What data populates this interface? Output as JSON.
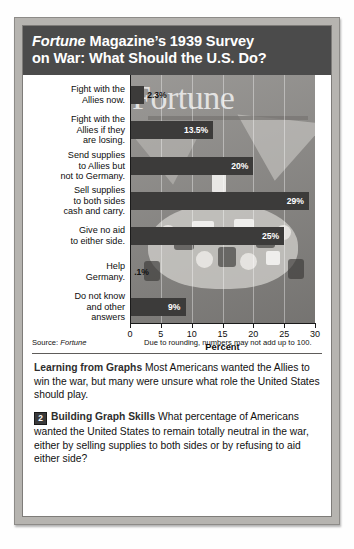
{
  "figure": {
    "title_prefix": "Fortune",
    "title_rest_line1": " Magazine’s 1939 Survey",
    "title_line2": "on War: What Should the U.S. Do?"
  },
  "chart_data": {
    "type": "bar",
    "orientation": "horizontal",
    "title": "Fortune Magazine’s 1939 Survey on War: What Should the U.S. Do?",
    "xlabel": "Percent",
    "ylabel": "",
    "xlim": [
      0,
      30
    ],
    "xticks": [
      "0",
      "5",
      "10",
      "15",
      "20",
      "25",
      "30"
    ],
    "grid": true,
    "legend": "none",
    "categories": [
      "Fight with the Allies now.",
      "Fight with the Allies if they are losing.",
      "Send supplies to Allies but not to Germany.",
      "Sell supplies to both sides cash and carry.",
      "Give no aid to either side.",
      "Help Germany.",
      "Do not know and other answers"
    ],
    "category_lines": [
      [
        "Fight with the",
        "Allies now."
      ],
      [
        "Fight with the",
        "Allies if they",
        "are losing."
      ],
      [
        "Send supplies",
        "to Allies but",
        "not to Germany."
      ],
      [
        "Sell supplies",
        "to both sides",
        "cash and carry."
      ],
      [
        "Give no aid",
        "to either side."
      ],
      [
        "Help",
        "Germany."
      ],
      [
        "Do not know",
        "and other",
        "answers"
      ]
    ],
    "values": [
      2.3,
      13.5,
      20,
      29,
      25,
      0.1,
      9
    ],
    "value_labels": [
      "2.3%",
      "13.5%",
      "20%",
      "29%",
      "25%",
      ".1%",
      "9%"
    ],
    "bar_color": "#3c3b3a",
    "source": "Source: Fortune",
    "source_label": "Source: ",
    "source_name": "Fortune",
    "note": "Due to rounding, numbers may not add up to 100."
  },
  "captions": [
    {
      "badge": "",
      "heading": "Learning from Graphs",
      "body": "Most Americans wanted the Allies to win the war, but many were unsure what role the United States should play."
    },
    {
      "badge": "2",
      "heading": "Building Graph Skills",
      "body": "What percentage of Americans wanted the United States to remain totally neutral in the war, either by selling supplies to both sides or by refusing to aid either side?"
    }
  ]
}
